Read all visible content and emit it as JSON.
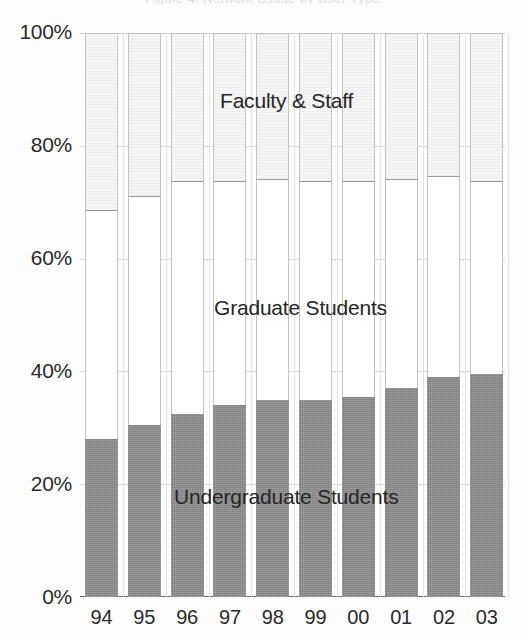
{
  "title_sliver": "Figure 4. Network Usage by User Type",
  "chart_data": {
    "type": "bar",
    "stacked": true,
    "normalized": "100%",
    "title": "",
    "xlabel": "",
    "ylabel": "",
    "ylim": [
      0,
      100
    ],
    "ytick_labels": [
      "100%",
      "80%",
      "60%",
      "40%",
      "20%",
      "0%"
    ],
    "ytick_values": [
      100,
      80,
      60,
      40,
      20,
      0
    ],
    "grid": true,
    "legend": "in-plot-labels",
    "categories": [
      "94",
      "95",
      "96",
      "97",
      "98",
      "99",
      "00",
      "01",
      "02",
      "03"
    ],
    "series": [
      {
        "name": "Undergraduate Students",
        "color": "#8e8e8e",
        "values": [
          28.0,
          30.5,
          32.5,
          34.0,
          35.0,
          35.0,
          35.5,
          37.0,
          39.0,
          39.5
        ]
      },
      {
        "name": "Graduate Students",
        "color": "#ffffff",
        "values": [
          40.5,
          40.5,
          41.0,
          39.5,
          39.0,
          38.5,
          38.0,
          37.0,
          35.5,
          34.0
        ]
      },
      {
        "name": "Faculty & Staff",
        "color": "#f1f1f1",
        "values": [
          31.5,
          29.0,
          26.5,
          26.5,
          26.0,
          26.5,
          26.5,
          26.0,
          25.5,
          26.5
        ]
      }
    ],
    "cumulative_top_of_graduate": [
      68.5,
      71.0,
      73.5,
      73.5,
      74.0,
      73.5,
      73.5,
      74.0,
      74.5,
      73.5
    ],
    "annotations": [
      {
        "text": "Faculty & Staff",
        "approx_y_percent": 87
      },
      {
        "text": "Graduate Students",
        "approx_y_percent": 52
      },
      {
        "text": "Undergraduate Students",
        "approx_y_percent": 19
      }
    ]
  }
}
